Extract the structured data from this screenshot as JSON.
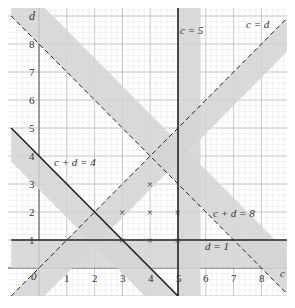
{
  "graph": {
    "axes": {
      "x_label": "c",
      "y_label": "d",
      "origin_label": "0",
      "x_ticks": [
        "1",
        "2",
        "3",
        "4",
        "5",
        "6",
        "7",
        "8"
      ],
      "y_ticks": [
        "1",
        "2",
        "3",
        "4",
        "5",
        "6",
        "7",
        "8"
      ]
    },
    "lines": [
      {
        "id": "c5",
        "label": "c = 5",
        "style": "solid"
      },
      {
        "id": "c_eq_d",
        "label": "c = d",
        "style": "dashed"
      },
      {
        "id": "c_plus_d_4",
        "label": "c + d = 4",
        "style": "solid"
      },
      {
        "id": "c_plus_d_8",
        "label": "c + d = 8",
        "style": "dashed"
      },
      {
        "id": "d1",
        "label": "d = 1",
        "style": "solid"
      }
    ],
    "feasible_points": [
      {
        "c": 3,
        "d": 1
      },
      {
        "c": 4,
        "d": 1
      },
      {
        "c": 5,
        "d": 1
      },
      {
        "c": 3,
        "d": 2
      },
      {
        "c": 4,
        "d": 2
      },
      {
        "c": 5,
        "d": 2
      },
      {
        "c": 4,
        "d": 3
      }
    ],
    "point_marker": "×",
    "colors": {
      "shade": "#d3d3d3",
      "line": "#222222",
      "grid_major": "#b8b8b8",
      "grid_minor": "#e2e2e2"
    }
  }
}
